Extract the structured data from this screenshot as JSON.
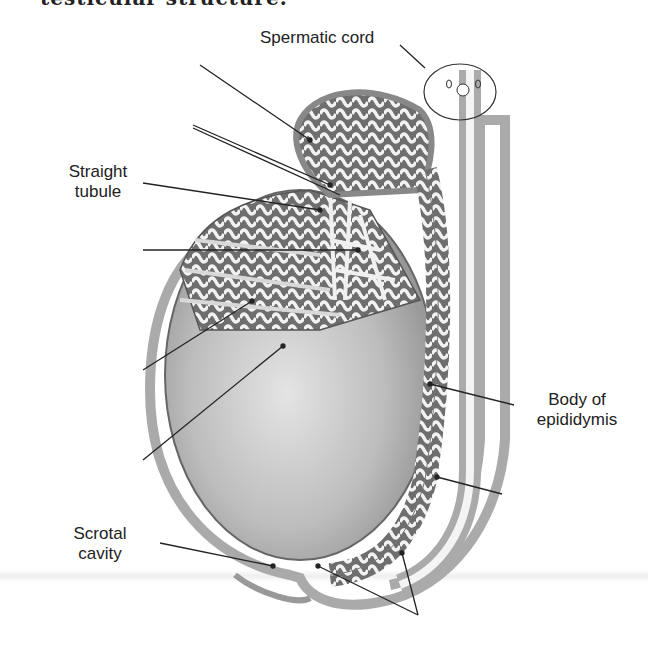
{
  "caption": "testicular structure.",
  "labels": {
    "spermatic_cord": "Spermatic cord",
    "straight_tubule_line1": "Straight",
    "straight_tubule_line2": "tubule",
    "body_epididymis_line1": "Body of",
    "body_epididymis_line2": "epididymis",
    "scrotal_cavity_line1": "Scrotal",
    "scrotal_cavity_line2": "cavity"
  },
  "colors": {
    "line": "#222222",
    "tissue_dark": "#8a8a8a",
    "tissue_mid": "#b5b5b5",
    "tissue_light": "#e6e6e6"
  }
}
